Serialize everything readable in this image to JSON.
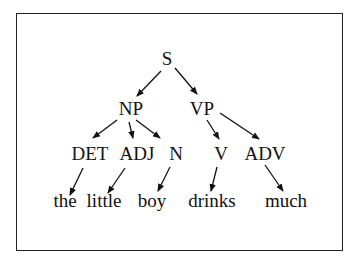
{
  "diagram": {
    "type": "parse-tree",
    "nodes": [
      {
        "id": "S",
        "label": "S",
        "level": 0
      },
      {
        "id": "NP",
        "label": "NP",
        "level": 1
      },
      {
        "id": "VP",
        "label": "VP",
        "level": 1
      },
      {
        "id": "DET",
        "label": "DET",
        "level": 2
      },
      {
        "id": "ADJ",
        "label": "ADJ",
        "level": 2
      },
      {
        "id": "N",
        "label": "N",
        "level": 2
      },
      {
        "id": "V",
        "label": "V",
        "level": 2
      },
      {
        "id": "ADV",
        "label": "ADV",
        "level": 2
      },
      {
        "id": "the",
        "label": "the",
        "level": 3
      },
      {
        "id": "little",
        "label": "little",
        "level": 3
      },
      {
        "id": "boy",
        "label": "boy",
        "level": 3
      },
      {
        "id": "drinks",
        "label": "drinks",
        "level": 3
      },
      {
        "id": "much",
        "label": "much",
        "level": 3
      }
    ],
    "edges": [
      {
        "from": "S",
        "to": "NP"
      },
      {
        "from": "S",
        "to": "VP"
      },
      {
        "from": "NP",
        "to": "DET"
      },
      {
        "from": "NP",
        "to": "ADJ"
      },
      {
        "from": "NP",
        "to": "N"
      },
      {
        "from": "VP",
        "to": "V"
      },
      {
        "from": "VP",
        "to": "ADV"
      },
      {
        "from": "DET",
        "to": "the"
      },
      {
        "from": "ADJ",
        "to": "little"
      },
      {
        "from": "N",
        "to": "boy"
      },
      {
        "from": "V",
        "to": "drinks"
      },
      {
        "from": "ADV",
        "to": "much"
      }
    ],
    "colors": {
      "ink": "#111111",
      "background": "#ffffff",
      "frame": "#222222"
    }
  }
}
